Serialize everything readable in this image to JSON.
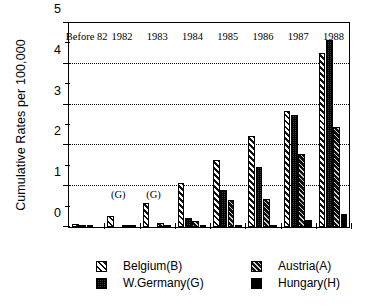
{
  "chart_data": {
    "type": "bar",
    "title": "",
    "xlabel": "",
    "ylabel": "Cumulative Rates per 100,000",
    "ylim": [
      0,
      5
    ],
    "yticks": [
      0,
      1,
      2,
      3,
      4,
      5
    ],
    "ytick_labels": [
      "0",
      "1",
      "2",
      "3",
      "4",
      "5"
    ],
    "yminor_ticks": [
      0.5,
      1.5,
      2.5,
      3.5,
      4.5
    ],
    "grid": "horizontal-dotted",
    "legend_position": "below",
    "categories": [
      "Before 82",
      "1982",
      "1983",
      "1984",
      "1985",
      "1986",
      "1987",
      "1988"
    ],
    "series": [
      {
        "name": "Belgium(B)",
        "key": "belgium",
        "pattern": "diagonal-hatch-wide",
        "values": [
          0.08,
          0.27,
          0.58,
          1.07,
          1.62,
          2.22,
          2.82,
          4.22
        ]
      },
      {
        "name": "W.Germany(G)",
        "key": "wgermany",
        "pattern": "checkered-dots",
        "values": [
          0.03,
          null,
          null,
          0.22,
          0.9,
          1.45,
          2.72,
          4.55
        ]
      },
      {
        "name": "Austria(A)",
        "key": "austria",
        "pattern": "diagonal-hatch-dense",
        "values": [
          0.02,
          0.05,
          0.09,
          0.15,
          0.65,
          0.68,
          1.78,
          2.43
        ]
      },
      {
        "name": "Hungary(H)",
        "key": "hungary",
        "pattern": "solid-black",
        "values": [
          0.0,
          0.02,
          0.02,
          0.02,
          0.03,
          0.05,
          0.17,
          0.32
        ]
      }
    ],
    "annotations": [
      {
        "text": "(G)",
        "category": "1982",
        "note": "W.Germany data not available"
      },
      {
        "text": "(G)",
        "category": "1983",
        "note": "W.Germany data not available"
      }
    ]
  },
  "legend": {
    "entries": [
      {
        "label": "Belgium(B)"
      },
      {
        "label": "Austria(A)"
      },
      {
        "label": "W.Germany(G)"
      },
      {
        "label": "Hungary(H)"
      }
    ]
  }
}
